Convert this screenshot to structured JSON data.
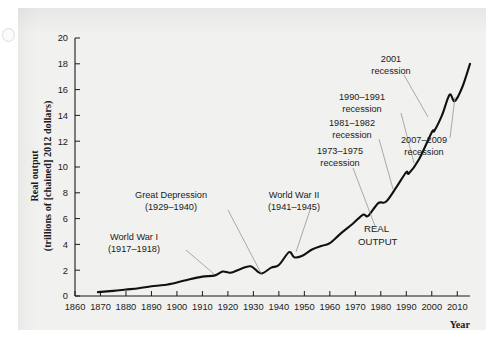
{
  "chart_data": {
    "type": "line",
    "title": "",
    "xlabel": "Year",
    "ylabel": "Real output (trillions of [chained] 2012 dollars)",
    "ylabel_line1": "Real output",
    "ylabel_line2": "(trillions of [chained] 2012 dollars)",
    "xlim": [
      1860,
      2015
    ],
    "ylim": [
      0,
      20
    ],
    "grid": false,
    "legend": "none",
    "xticks": [
      1860,
      1870,
      1880,
      1890,
      1900,
      1910,
      1920,
      1930,
      1940,
      1950,
      1960,
      1970,
      1980,
      1990,
      2000,
      2010
    ],
    "yticks": [
      0,
      2,
      4,
      6,
      8,
      10,
      12,
      14,
      16,
      18,
      20
    ],
    "series": [
      {
        "name": "REAL OUTPUT",
        "color": "#111111",
        "x": [
          1869,
          1875,
          1880,
          1885,
          1890,
          1895,
          1900,
          1905,
          1910,
          1915,
          1918,
          1921,
          1925,
          1929,
          1933,
          1937,
          1940,
          1944,
          1946,
          1949,
          1953,
          1957,
          1960,
          1964,
          1969,
          1973,
          1975,
          1979,
          1982,
          1986,
          1990,
          1991,
          1995,
          2000,
          2001,
          2004,
          2007,
          2009,
          2012,
          2015
        ],
        "values": [
          0.3,
          0.4,
          0.5,
          0.6,
          0.75,
          0.85,
          1.05,
          1.3,
          1.5,
          1.6,
          1.9,
          1.8,
          2.1,
          2.3,
          1.75,
          2.2,
          2.4,
          3.4,
          3.0,
          3.1,
          3.6,
          3.9,
          4.1,
          4.8,
          5.6,
          6.3,
          6.2,
          7.2,
          7.3,
          8.4,
          9.6,
          9.5,
          10.6,
          12.7,
          12.8,
          14.0,
          15.6,
          15.1,
          16.2,
          18.0
        ],
        "note": "US real GDP, trillions of chained 2012 dollars"
      }
    ],
    "series_label": "REAL\nOUTPUT",
    "series_label_line1": "REAL",
    "series_label_line2": "OUTPUT",
    "annotations": [
      {
        "id": "world-war-i",
        "line1": "World War I",
        "line2": "(1917–1918)",
        "text_x": 134,
        "text_y": 240,
        "leader_from": [
          186,
          250
        ],
        "leader_to": [
          214,
          274
        ]
      },
      {
        "id": "great-depression",
        "line1": "Great Depression",
        "line2": "(1929–1940)",
        "text_x": 171,
        "text_y": 198,
        "leader_from": [
          228,
          210
        ],
        "leader_to": [
          262,
          275
        ]
      },
      {
        "id": "world-war-ii",
        "line1": "World War II",
        "line2": "(1941–1945)",
        "text_x": 294,
        "text_y": 198,
        "leader_from": [
          310,
          210
        ],
        "leader_to": [
          296,
          252
        ]
      },
      {
        "id": "recession-1973-1975",
        "line1": "1973–1975",
        "line2": "recession",
        "text_x": 340,
        "text_y": 154,
        "leader_from": [
          353,
          168
        ],
        "leader_to": [
          375,
          226
        ]
      },
      {
        "id": "recession-1981-1982",
        "line1": "1981–1982",
        "line2": "recession",
        "text_x": 352,
        "text_y": 126,
        "leader_from": [
          379,
          139
        ],
        "leader_to": [
          393,
          189
        ]
      },
      {
        "id": "recession-1990-1991",
        "line1": "1990–1991",
        "line2": "recession",
        "text_x": 362,
        "text_y": 100,
        "leader_from": [
          401,
          113
        ],
        "leader_to": [
          414,
          163
        ]
      },
      {
        "id": "recession-2001",
        "line1": "2001",
        "line2": "recession",
        "text_x": 391,
        "text_y": 62,
        "leader_from": [
          404,
          75
        ],
        "leader_to": [
          428,
          117
        ]
      },
      {
        "id": "recession-2007-2009",
        "line1": "2007–2009",
        "line2": "recession",
        "text_x": 424,
        "text_y": 143,
        "leader_from": [
          450,
          138
        ],
        "leader_to": [
          455,
          97
        ]
      }
    ]
  }
}
